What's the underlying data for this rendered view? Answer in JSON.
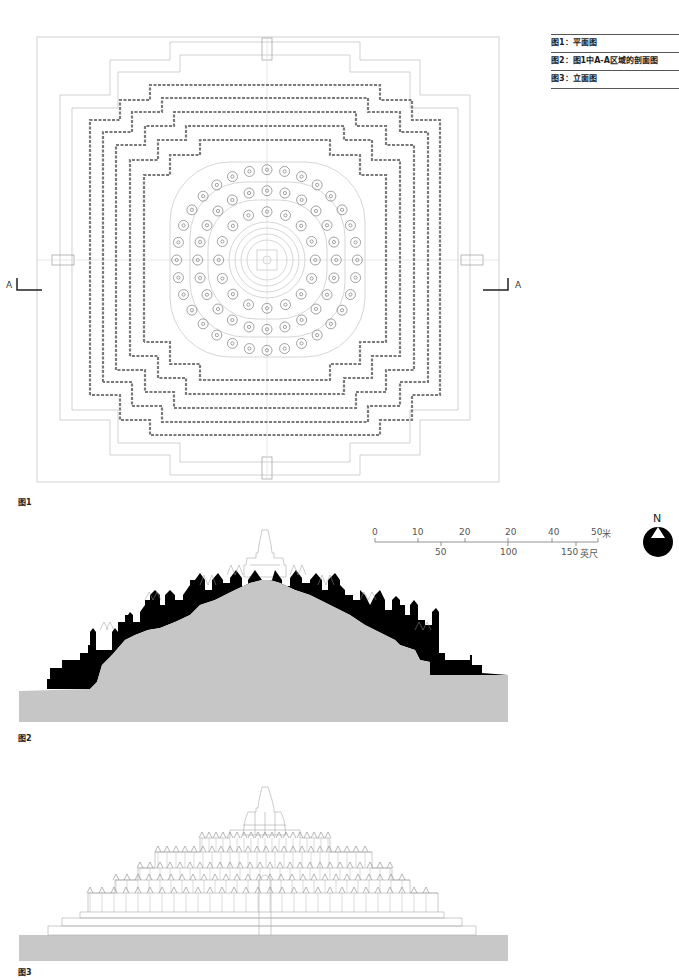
{
  "legend": {
    "items": [
      {
        "label": "图1：平面图"
      },
      {
        "label": "图2：图1中A-A区域的剖面图"
      },
      {
        "label": "图3：立面图"
      }
    ]
  },
  "figures": {
    "fig1": {
      "caption": "图1",
      "type": "plan",
      "section_marker_left": "A",
      "section_marker_right": "A"
    },
    "fig2": {
      "caption": "图2",
      "type": "section"
    },
    "fig3": {
      "caption": "图3",
      "type": "elevation"
    }
  },
  "scale_bar": {
    "meters_ticks": [
      "0",
      "10",
      "20",
      "20",
      "40",
      "50"
    ],
    "meters_unit": "米",
    "feet_ticks": [
      "50",
      "100",
      "150"
    ],
    "feet_unit": "英尺"
  },
  "north_arrow": {
    "label": "N"
  },
  "colors": {
    "ground_fill": "#c8c8c8",
    "section_fill": "#000000",
    "line": "#9a9a9a"
  }
}
